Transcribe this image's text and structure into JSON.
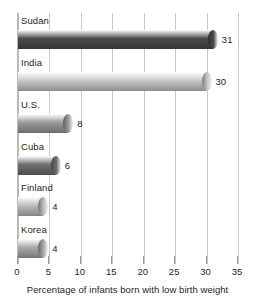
{
  "chart_data": {
    "type": "bar",
    "orientation": "horizontal",
    "title": "",
    "xlabel": "Percentage of infants born with low birth weight",
    "ylabel": "",
    "categories": [
      "Sudan",
      "India",
      "U.S.",
      "Cuba",
      "Finland",
      "Korea"
    ],
    "values": [
      31,
      30,
      8,
      6,
      4,
      4
    ],
    "value_labels": [
      "31",
      "30",
      "8",
      "6",
      "4",
      "4"
    ],
    "xlim": [
      0,
      35
    ],
    "xticks": [
      0,
      5,
      10,
      15,
      20,
      25,
      30,
      35
    ],
    "xtick_labels": [
      "0",
      "5",
      "10",
      "15",
      "20",
      "25",
      "30",
      "35"
    ],
    "grid": true,
    "grid_axis": "x",
    "legend": false,
    "bar_colors": [
      "#4b4b4b",
      "#c8c8c8",
      "#9a9a9a",
      "#6e6e6e",
      "#bdbdbd",
      "#a8a8a8"
    ]
  },
  "axis": {
    "caption": "Percentage of infants born with low birth weight"
  },
  "colors": {
    "gridline": "#c9c9c9",
    "axis_line": "#b9b9b9",
    "text": "#231f20",
    "background": "#ffffff"
  }
}
